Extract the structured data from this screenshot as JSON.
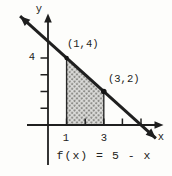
{
  "figure": {
    "y_axis_label": "y",
    "x_axis_label": "x",
    "y_tick_label_4": "4",
    "x_tick_label_1": "1",
    "x_tick_label_3": "3",
    "point_label_1": "(1,4)",
    "point_label_2": "(3,2)",
    "formula": "f(x) = 5 - x",
    "ink_color": "#1f1f1f",
    "shade_dot_color": "#8d8d89",
    "shade_bg_color": "#dddddb"
  },
  "chart_data": {
    "type": "line",
    "title": "",
    "xlabel": "x",
    "ylabel": "y",
    "function": "f(x) = 5 - x",
    "line_extent": [
      [
        -1.5,
        6.5
      ],
      [
        5.8,
        -0.8
      ]
    ],
    "marked_points": [
      {
        "x": 1,
        "y": 4,
        "label": "(1,4)"
      },
      {
        "x": 3,
        "y": 2,
        "label": "(3,2)"
      }
    ],
    "shaded_region": {
      "vertices": [
        [
          1,
          0
        ],
        [
          1,
          4
        ],
        [
          3,
          2
        ],
        [
          3,
          0
        ]
      ],
      "description": "shaded area under f(x) = 5 - x between x = 1 and x = 3"
    },
    "x_ticks": [
      1,
      2,
      3,
      4,
      5
    ],
    "y_ticks": [
      1,
      2,
      3,
      4
    ],
    "x_tick_labels_shown": [
      "1",
      "3"
    ],
    "y_tick_labels_shown": [
      "4"
    ],
    "xlim": [
      -1.2,
      6.7
    ],
    "ylim": [
      -3.1,
      6.7
    ],
    "grid": false,
    "legend": "none",
    "annotation": "f(x) = 5 - x"
  }
}
